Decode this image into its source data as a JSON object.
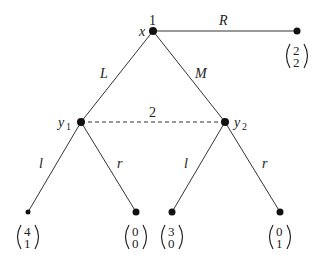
{
  "diagram": {
    "type": "extensive-form game tree",
    "root": {
      "node_name": "x",
      "player": "1"
    },
    "root_actions": {
      "left": "L",
      "middle": "M",
      "right": "R"
    },
    "information_set": {
      "player": "2",
      "nodes": [
        "y1",
        "y2"
      ]
    },
    "y1": {
      "base": "y",
      "sub": "1"
    },
    "y2": {
      "base": "y",
      "sub": "2"
    },
    "player2_actions": {
      "left": "l",
      "right": "r"
    },
    "payoffs": {
      "R": {
        "p1": "2",
        "p2": "2"
      },
      "L_l": {
        "p1": "4",
        "p2": "1"
      },
      "L_r": {
        "p1": "0",
        "p2": "0"
      },
      "M_l": {
        "p1": "3",
        "p2": "0"
      },
      "M_r": {
        "p1": "0",
        "p2": "1"
      }
    }
  }
}
